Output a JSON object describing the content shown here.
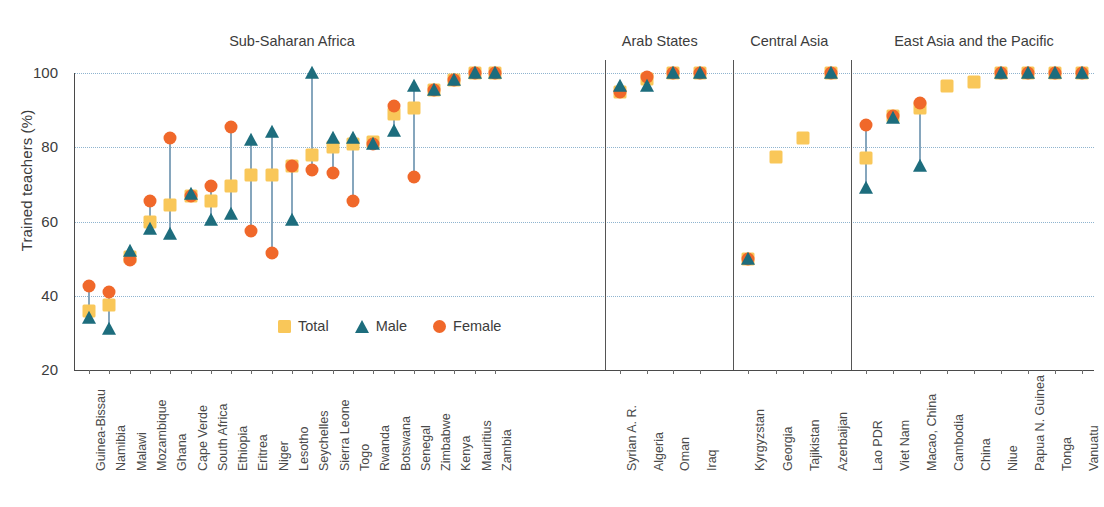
{
  "chart_data": {
    "type": "scatter",
    "title": "",
    "xlabel": "",
    "ylabel": "Trained teachers (%)",
    "ylim": [
      20,
      100
    ],
    "yticks": [
      20,
      40,
      60,
      80,
      100
    ],
    "grid": true,
    "legend_position": "inside-bottom-left",
    "legend": [
      {
        "name": "Total",
        "marker": "square",
        "color": "#f9c759"
      },
      {
        "name": "Male",
        "marker": "triangle",
        "color": "#1d6d7d"
      },
      {
        "name": "Female",
        "marker": "circle",
        "color": "#f0682a"
      }
    ],
    "series": [
      {
        "name": "Total",
        "values": [
          36,
          37.5,
          50.5,
          60,
          64.5,
          67,
          65.5,
          69.5,
          72.5,
          72.5,
          75,
          78,
          80,
          81,
          81.5,
          89,
          90.5,
          95.5,
          98,
          100,
          100,
          95,
          98.5,
          100,
          100,
          50,
          77.5,
          82.5,
          100,
          77,
          88.5,
          90.5,
          96.5,
          97.5,
          100,
          100,
          100,
          100
        ]
      },
      {
        "name": "Male",
        "values": [
          34,
          31,
          52,
          58,
          56.5,
          67.5,
          60.5,
          62,
          82,
          84,
          60.5,
          100,
          82.5,
          82.5,
          81,
          84.5,
          96.5,
          95.5,
          98,
          100,
          100,
          96.5,
          96.5,
          100,
          100,
          50,
          null,
          null,
          100,
          69,
          88,
          75,
          null,
          null,
          100,
          100,
          100,
          100
        ]
      },
      {
        "name": "Female",
        "values": [
          42.5,
          41,
          49.5,
          65.5,
          82.5,
          67,
          69.5,
          85.5,
          57.5,
          51.5,
          75,
          74,
          73,
          65.5,
          81,
          91,
          72,
          95.5,
          98,
          100,
          100,
          95,
          99,
          100,
          100,
          50,
          null,
          null,
          100,
          86,
          88.5,
          92,
          null,
          null,
          100,
          100,
          100,
          100
        ]
      }
    ],
    "categories": [
      "Guinea-Bissau",
      "Namibia",
      "Malawi",
      "Mozambique",
      "Ghana",
      "Cape Verde",
      "South Africa",
      "Ethiopia",
      "Eritrea",
      "Niger",
      "Lesotho",
      "Seychelles",
      "Sierra Leone",
      "Togo",
      "Rwanda",
      "Botswana",
      "Senegal",
      "Zimbabwe",
      "Kenya",
      "Mauritius",
      "Zambia",
      "Syrian A. R.",
      "Algeria",
      "Oman",
      "Iraq",
      "Kyrgyzstan",
      "Georgia",
      "Tajikistan",
      "Azerbaijan",
      "Lao PDR",
      "Viet Nam",
      "Macao, China",
      "Cambodia",
      "China",
      "Niue",
      "Papua N. Guinea",
      "Tonga",
      "Vanuatu"
    ],
    "regions": [
      {
        "label": "Sub-Saharan Africa",
        "start": 0,
        "end": 20
      },
      {
        "label": "Arab States",
        "start": 21,
        "end": 24
      },
      {
        "label": "Central Asia",
        "start": 25,
        "end": 28
      },
      {
        "label": "East Asia and the Pacific",
        "start": 29,
        "end": 37
      }
    ],
    "points": [
      {
        "category": "Guinea-Bissau",
        "total": 36,
        "male": 34,
        "female": 42.5
      },
      {
        "category": "Namibia",
        "total": 37.5,
        "male": 31,
        "female": 41
      },
      {
        "category": "Malawi",
        "total": 50.5,
        "male": 52,
        "female": 49.5
      },
      {
        "category": "Mozambique",
        "total": 60,
        "male": 58,
        "female": 65.5
      },
      {
        "category": "Ghana",
        "total": 64.5,
        "male": 56.5,
        "female": 82.5
      },
      {
        "category": "Cape Verde",
        "total": 67,
        "male": 67.5,
        "female": 67
      },
      {
        "category": "South Africa",
        "total": 65.5,
        "male": 60.5,
        "female": 69.5
      },
      {
        "category": "Ethiopia",
        "total": 69.5,
        "male": 62,
        "female": 85.5
      },
      {
        "category": "Eritrea",
        "total": 72.5,
        "male": 82,
        "female": 57.5
      },
      {
        "category": "Niger",
        "total": 72.5,
        "male": 84,
        "female": 51.5
      },
      {
        "category": "Lesotho",
        "total": 75,
        "male": 60.5,
        "female": 75
      },
      {
        "category": "Seychelles",
        "total": 78,
        "male": 100,
        "female": 74
      },
      {
        "category": "Sierra Leone",
        "total": 80,
        "male": 82.5,
        "female": 73
      },
      {
        "category": "Togo",
        "total": 81,
        "male": 82.5,
        "female": 65.5
      },
      {
        "category": "Rwanda",
        "total": 81.5,
        "male": 81,
        "female": 81
      },
      {
        "category": "Botswana",
        "total": 89,
        "male": 84.5,
        "female": 91
      },
      {
        "category": "Senegal",
        "total": 90.5,
        "male": 96.5,
        "female": 72
      },
      {
        "category": "Zimbabwe",
        "total": 95.5,
        "male": 95.5,
        "female": 95.5
      },
      {
        "category": "Kenya",
        "total": 98,
        "male": 98,
        "female": 98
      },
      {
        "category": "Mauritius",
        "total": 100,
        "male": 100,
        "female": 100
      },
      {
        "category": "Zambia",
        "total": 100,
        "male": 100,
        "female": 100
      },
      {
        "category": "Syrian A. R.",
        "total": 95,
        "male": 96.5,
        "female": 95
      },
      {
        "category": "Algeria",
        "total": 98.5,
        "male": 96.5,
        "female": 99
      },
      {
        "category": "Oman",
        "total": 100,
        "male": 100,
        "female": 100
      },
      {
        "category": "Iraq",
        "total": 100,
        "male": 100,
        "female": 100
      },
      {
        "category": "Kyrgyzstan",
        "total": 50,
        "male": 50,
        "female": 50
      },
      {
        "category": "Georgia",
        "total": 77.5,
        "male": null,
        "female": null
      },
      {
        "category": "Tajikistan",
        "total": 82.5,
        "male": null,
        "female": null
      },
      {
        "category": "Azerbaijan",
        "total": 100,
        "male": 100,
        "female": 100
      },
      {
        "category": "Lao PDR",
        "total": 77,
        "male": 69,
        "female": 86
      },
      {
        "category": "Viet Nam",
        "total": 88.5,
        "male": 88,
        "female": 88.5
      },
      {
        "category": "Macao, China",
        "total": 90.5,
        "male": 75,
        "female": 92
      },
      {
        "category": "Cambodia",
        "total": 96.5,
        "male": null,
        "female": null
      },
      {
        "category": "China",
        "total": 97.5,
        "male": null,
        "female": null
      },
      {
        "category": "Niue",
        "total": 100,
        "male": 100,
        "female": 100
      },
      {
        "category": "Papua N. Guinea",
        "total": 100,
        "male": 100,
        "female": 100
      },
      {
        "category": "Tonga",
        "total": 100,
        "male": 100,
        "female": 100
      },
      {
        "category": "Vanuatu",
        "total": 100,
        "male": 100,
        "female": 100
      }
    ]
  }
}
